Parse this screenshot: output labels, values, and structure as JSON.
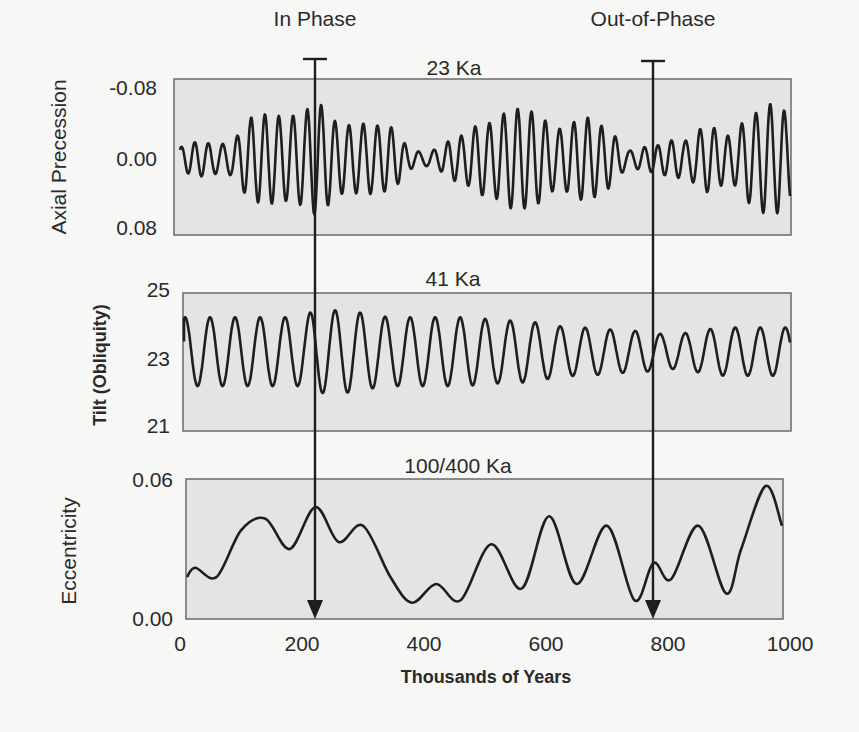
{
  "chart_data": {
    "type": "line",
    "title": "",
    "xlabel": "Thousands of Years",
    "x_ticks": [
      0,
      200,
      400,
      600,
      800,
      1000
    ],
    "xlim": [
      0,
      1000
    ],
    "annotations": [
      {
        "label": "In Phase",
        "x": 222
      },
      {
        "label": "Out-of-Phase",
        "x": 776
      }
    ],
    "panels": [
      {
        "name": "axial-precession",
        "ylabel": "Axial Precession",
        "period_label": "23 Ka",
        "y_ticks": [
          "-0.08",
          "0.00",
          "0.08"
        ],
        "ylim": [
          -0.08,
          0.08
        ],
        "y_inverted": true,
        "period_ka": 23,
        "envelope_x": [
          0,
          40,
          80,
          120,
          160,
          200,
          222,
          260,
          300,
          340,
          380,
          420,
          460,
          500,
          540,
          580,
          620,
          660,
          700,
          740,
          780,
          820,
          860,
          900,
          940,
          960,
          980,
          1000
        ],
        "envelope_amp": [
          0.01,
          0.015,
          0.02,
          0.04,
          0.045,
          0.05,
          0.055,
          0.035,
          0.04,
          0.03,
          0.01,
          0.012,
          0.02,
          0.04,
          0.05,
          0.045,
          0.035,
          0.04,
          0.03,
          0.012,
          0.01,
          0.02,
          0.035,
          0.02,
          0.05,
          0.06,
          0.055,
          0.04
        ]
      },
      {
        "name": "tilt-obliquity",
        "ylabel": "Tilt (Obliquity)",
        "period_label": "41 Ka",
        "y_ticks": [
          "25",
          "23",
          "21"
        ],
        "ylim": [
          21,
          25
        ],
        "y_inverted": false,
        "period_ka": 41,
        "center": 23.3,
        "envelope_x": [
          0,
          100,
          200,
          222,
          260,
          350,
          450,
          550,
          650,
          750,
          800,
          900,
          1000
        ],
        "envelope_amp": [
          1.0,
          1.0,
          1.0,
          1.2,
          1.2,
          1.0,
          1.0,
          0.9,
          0.7,
          0.6,
          0.5,
          0.7,
          0.7
        ]
      },
      {
        "name": "eccentricity",
        "ylabel": "Eccentricity",
        "period_label": "100/400 Ka",
        "y_ticks": [
          "0.06",
          "0.00"
        ],
        "ylim": [
          0.0,
          0.06
        ],
        "y_inverted": false,
        "x": [
          0,
          25,
          60,
          100,
          140,
          180,
          222,
          260,
          300,
          345,
          380,
          420,
          460,
          510,
          560,
          605,
          650,
          700,
          745,
          776,
          805,
          850,
          895,
          920,
          960,
          1000
        ],
        "y": [
          0.018,
          0.022,
          0.018,
          0.038,
          0.043,
          0.03,
          0.048,
          0.033,
          0.04,
          0.018,
          0.007,
          0.015,
          0.008,
          0.032,
          0.013,
          0.044,
          0.015,
          0.04,
          0.008,
          0.024,
          0.017,
          0.04,
          0.011,
          0.03,
          0.057,
          0.04
        ]
      }
    ]
  },
  "labels": {
    "in_phase": "In Phase",
    "out_of_phase": "Out-of-Phase",
    "xlabel": "Thousands of Years"
  },
  "colors": {
    "panel_fill": "#e4e4e2",
    "panel_stroke": "#6a6a6a",
    "curve": "#1e1e1e",
    "background": "#f7f7f5"
  }
}
